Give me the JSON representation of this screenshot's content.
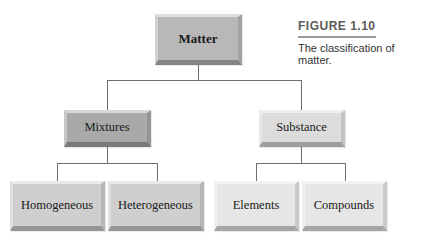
{
  "figure": {
    "label": "FIGURE 1.10",
    "caption": "The classification of matter."
  },
  "nodes": {
    "root": "Matter",
    "mixtures": "Mixtures",
    "substance": "Substance",
    "homogeneous": "Homogeneous",
    "heterogeneous": "Heterogeneous",
    "elements": "Elements",
    "compounds": "Compounds"
  },
  "colors": {
    "root_fill": "#b8b8b8",
    "mixtures_fill": "#a9a9a9",
    "substance_fill": "#dcdcdc",
    "mixture_children_fill": "#cfcfcf",
    "substance_children_fill": "#e6e6e6",
    "connector": "#6e6e6e"
  }
}
